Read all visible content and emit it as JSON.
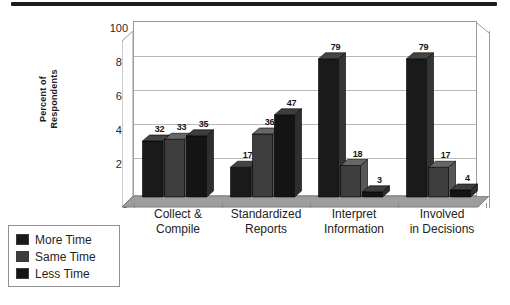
{
  "decor": {
    "top_rule_color": "#1c1c1c"
  },
  "chart_data": {
    "type": "bar",
    "title": "",
    "subtitle": "",
    "xlabel": "",
    "ylabel": "Percent of Respondents",
    "ylabel_lines": [
      "Percent of",
      "Respondents"
    ],
    "ylim": [
      0,
      100
    ],
    "ytick_values": [
      0,
      20,
      40,
      60,
      80,
      100
    ],
    "ytick_labels": [
      "0",
      "20",
      "40",
      "60",
      "80",
      "100"
    ],
    "grid": true,
    "grid_axis": "y",
    "legend_position": "lower-left-outside",
    "three_d": true,
    "categories": [
      "Collect & Compile",
      "Standardized Reports",
      "Interpret Information",
      "Involved in Decisions"
    ],
    "category_lines": [
      [
        "Collect &",
        "Compile"
      ],
      [
        "Standardized",
        "Reports"
      ],
      [
        "Interpret",
        "Information"
      ],
      [
        "Involved",
        "in Decisions"
      ]
    ],
    "series": [
      {
        "name": "More Time",
        "color": "#1a1a1a",
        "values": [
          32,
          17,
          79,
          79
        ],
        "labels": [
          "32",
          "17",
          "79",
          "79"
        ]
      },
      {
        "name": "Same Time",
        "color": "#3d3d3d",
        "values": [
          33,
          36,
          18,
          17
        ],
        "labels": [
          "33",
          "36",
          "18",
          "17"
        ]
      },
      {
        "name": "Less Time",
        "color": "#141414",
        "values": [
          35,
          47,
          3,
          4
        ],
        "labels": [
          "35",
          "47",
          "3",
          "4"
        ]
      }
    ]
  },
  "legend": {
    "items": [
      {
        "label": "More Time",
        "color": "#1a1a1a"
      },
      {
        "label": "Same Time",
        "color": "#3d3d3d"
      },
      {
        "label": "Less Time",
        "color": "#141414"
      }
    ]
  }
}
